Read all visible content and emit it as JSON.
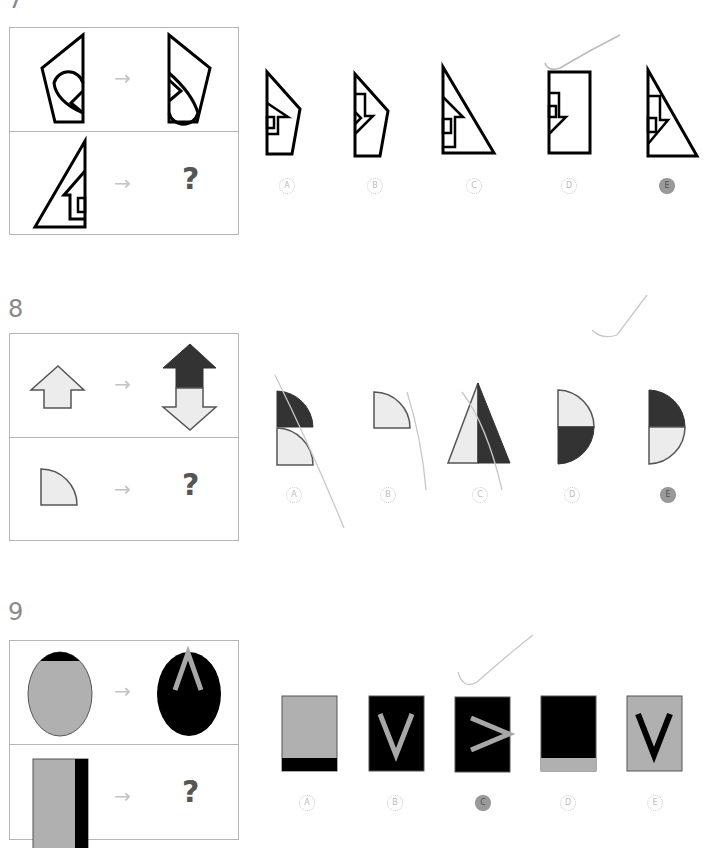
{
  "questions": [
    {
      "number": "7",
      "arrow": "→",
      "question_mark": "?",
      "options": [
        {
          "label": "A",
          "marked": false
        },
        {
          "label": "B",
          "marked": false
        },
        {
          "label": "C",
          "marked": false
        },
        {
          "label": "D",
          "marked": false
        },
        {
          "label": "E",
          "marked": true
        }
      ]
    },
    {
      "number": "8",
      "arrow": "→",
      "question_mark": "?",
      "options": [
        {
          "label": "A",
          "marked": false
        },
        {
          "label": "B",
          "marked": false
        },
        {
          "label": "C",
          "marked": false
        },
        {
          "label": "D",
          "marked": false
        },
        {
          "label": "E",
          "marked": true
        }
      ]
    },
    {
      "number": "9",
      "arrow": "→",
      "question_mark": "?",
      "options": [
        {
          "label": "A",
          "marked": false
        },
        {
          "label": "B",
          "marked": false
        },
        {
          "label": "C",
          "marked": true
        },
        {
          "label": "D",
          "marked": false
        },
        {
          "label": "E",
          "marked": false
        }
      ],
      "letters": {
        "top_right": "Λ",
        "option_b": "V",
        "option_c": ">",
        "option_e": "V"
      }
    }
  ],
  "colors": {
    "dark_fill": "#333333",
    "light_fill": "#ececec",
    "gray_fill": "#b0b0b0",
    "black": "#000000",
    "border": "#b5b5b5"
  }
}
